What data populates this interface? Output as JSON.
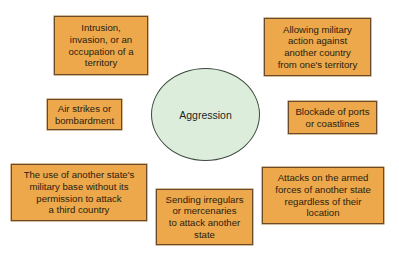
{
  "diagram": {
    "center": {
      "label": "Aggression",
      "fill_color": "#dceedb"
    },
    "box_fill_color": "#eca84b",
    "nodes": [
      {
        "id": "intrusion",
        "text": "Intrusion,\ninvasion, or an\noccupation of a\nterritory"
      },
      {
        "id": "allowing",
        "text": "Allowing military\naction against\nanother country\nfrom one's territory"
      },
      {
        "id": "airstrikes",
        "text": "Air strikes or\nbombardment"
      },
      {
        "id": "blockade",
        "text": "Blockade of ports\nor coastlines"
      },
      {
        "id": "basing",
        "text": "The use of another state's\nmilitary base without its\npermission to attack\na third country"
      },
      {
        "id": "irregulars",
        "text": "Sending irregulars\nor mercenaries\nto attack another\nstate"
      },
      {
        "id": "armed",
        "text": "Attacks on the armed\nforces of another state\nregardless of their\nlocation"
      }
    ]
  }
}
